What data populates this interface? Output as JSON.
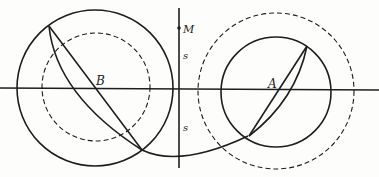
{
  "diagram": {
    "colors": {
      "stroke": "#1e1e1e",
      "background": "#fdfdfc",
      "text": "#222222"
    },
    "labels": {
      "point_b": "B",
      "point_a": "A",
      "point_m": "M",
      "distance_upper": "s",
      "distance_lower": "s"
    },
    "elements": [
      "horizontal-axis",
      "vertical-axis",
      "circle-b-solid",
      "circle-b-dashed",
      "circle-a-solid",
      "circle-a-dashed",
      "chord-b",
      "arc-b",
      "connecting-arc",
      "chord-a",
      "arc-a",
      "point-m"
    ]
  }
}
